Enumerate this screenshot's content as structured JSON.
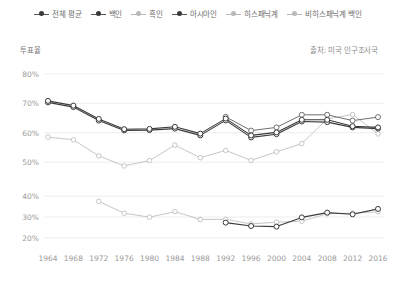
{
  "legend": {
    "items": [
      {
        "label": "전체 평균",
        "style": "dark",
        "icon": "line-marker-icon"
      },
      {
        "label": "백인",
        "style": "dark",
        "icon": "line-marker-icon"
      },
      {
        "label": "흑인",
        "style": "light",
        "icon": "line-marker-icon"
      },
      {
        "label": "아시아인",
        "style": "dark",
        "icon": "line-marker-icon"
      },
      {
        "label": "히스패닉계",
        "style": "light",
        "icon": "line-marker-icon"
      },
      {
        "label": "비히스패닉계 백인",
        "style": "light",
        "icon": "line-marker-icon"
      }
    ]
  },
  "axis_title": "투표율",
  "source_note": "출처: 미국 인구조사국",
  "chart_data": {
    "type": "line",
    "title": "",
    "subtitle": "",
    "xlabel": "",
    "ylabel": "투표율",
    "grid": true,
    "legend_position": "top",
    "x": [
      1964,
      1968,
      1972,
      1976,
      1980,
      1984,
      1988,
      1992,
      1996,
      2000,
      2004,
      2008,
      2012,
      2016
    ],
    "panels": [
      {
        "name": "upper-panel",
        "ylim": [
          48,
          82
        ],
        "yticks": [
          50,
          60,
          70,
          80
        ],
        "ytick_labels": [
          "50%",
          "60%",
          "70%",
          "80%"
        ],
        "series": [
          {
            "name": "전체 평균",
            "style": "dark",
            "values": [
              70.3,
              68.7,
              64.1,
              60.8,
              60.9,
              61.4,
              59.1,
              64.2,
              58.4,
              59.5,
              63.8,
              63.6,
              61.8,
              61.4
            ]
          },
          {
            "name": "백인",
            "style": "dark",
            "values": [
              70.8,
              69.2,
              64.7,
              61.2,
              61.3,
              62.0,
              59.7,
              64.8,
              59.1,
              60.1,
              64.4,
              64.4,
              62.2,
              61.8
            ]
          },
          {
            "name": "비히스패닉계 백인",
            "style": "light-dark",
            "values": [
              null,
              null,
              null,
              null,
              null,
              null,
              null,
              65.4,
              60.7,
              61.8,
              66.1,
              66.1,
              64.1,
              65.3
            ]
          },
          {
            "name": "흑인",
            "style": "light",
            "values": [
              58.5,
              57.6,
              52.1,
              48.7,
              50.5,
              55.8,
              51.5,
              54.0,
              50.6,
              53.5,
              56.3,
              64.7,
              66.2,
              59.6
            ]
          }
        ]
      },
      {
        "name": "lower-panel",
        "ylim": [
          18,
          42
        ],
        "yticks": [
          20,
          30,
          40
        ],
        "ytick_labels": [
          "20%",
          "30%",
          "40%"
        ],
        "series": [
          {
            "name": "히스패닉계",
            "style": "light",
            "values": [
              null,
              null,
              37.5,
              31.8,
              29.9,
              32.6,
              28.8,
              28.9,
              26.7,
              27.5,
              28.0,
              31.6,
              31.8,
              32.5
            ]
          },
          {
            "name": "아시아인",
            "style": "dark",
            "values": [
              null,
              null,
              null,
              null,
              null,
              null,
              null,
              27.3,
              25.7,
              25.4,
              29.8,
              32.1,
              31.3,
              33.9
            ]
          }
        ]
      }
    ]
  },
  "colors": {
    "dark_line": "#3a3a3a",
    "mid_line": "#6f6f6f",
    "light_line": "#c0c0c0",
    "grid": "#e8e8e8",
    "text": "#8a8a8a",
    "background": "#ffffff"
  }
}
